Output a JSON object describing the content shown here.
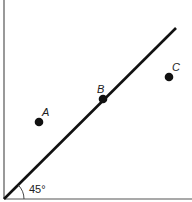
{
  "diagram": {
    "type": "geometric-plot",
    "angle_label": "45°",
    "colors": {
      "line": "#111111",
      "axis": "#555555",
      "point": "#111111",
      "background": "#ffffff"
    },
    "axes": {
      "origin": [
        4,
        199
      ],
      "x_end": [
        192,
        199
      ],
      "y_end": [
        4,
        0
      ]
    },
    "line": {
      "from": [
        4,
        199
      ],
      "to": [
        176,
        28
      ],
      "angle_deg": 45
    },
    "points": [
      {
        "label": "A",
        "x": 39,
        "y": 122,
        "label_x": 42,
        "label_y": 116
      },
      {
        "label": "B",
        "x": 103,
        "y": 99,
        "label_x": 97,
        "label_y": 93
      },
      {
        "label": "C",
        "x": 169,
        "y": 77,
        "label_x": 172,
        "label_y": 71
      }
    ]
  }
}
